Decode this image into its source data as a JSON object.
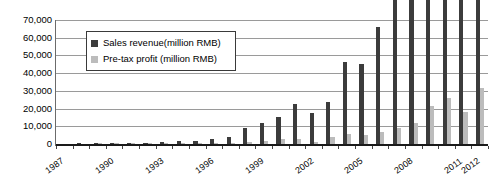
{
  "chart_data": {
    "type": "bar",
    "title": "",
    "xlabel": "",
    "ylabel": "",
    "ylim": [
      0,
      70000
    ],
    "ytick_step": 10000,
    "grid": true,
    "legend_position": "top-left-inside",
    "categories": [
      "1987",
      "1988",
      "1989",
      "1990",
      "1991",
      "1992",
      "1993",
      "1994",
      "1995",
      "1996",
      "1997",
      "1998",
      "1999",
      "2000",
      "2001",
      "2002",
      "2003",
      "2004",
      "2005",
      "2006",
      "2007",
      "2008",
      "2009",
      "2010",
      "2011",
      "2012"
    ],
    "xtick_labels_shown": [
      "1987",
      "1990",
      "1993",
      "1996",
      "1999",
      "2002",
      "2005",
      "2008",
      "2011",
      "2012"
    ],
    "ytick_labels": [
      "0",
      "10,000",
      "20,000",
      "30,000",
      "40,000",
      "50,000",
      "60,000",
      "70,000"
    ],
    "ytick_values": [
      0,
      10000,
      20000,
      30000,
      40000,
      50000,
      60000,
      70000
    ],
    "series": [
      {
        "name": "Sales revenue(million RMB)",
        "color": "#3c3c3c",
        "values": [
          0,
          10,
          50,
          120,
          250,
          800,
          1000,
          1500,
          1500,
          2600,
          4100,
          8900,
          12000,
          15200,
          22500,
          17500,
          23900,
          46200,
          45300,
          66000,
          93900,
          125200,
          149100,
          185200,
          203900,
          220200
        ]
      },
      {
        "name": "Pre-tax profit (million RMB)",
        "color": "#bcbcbc",
        "values": [
          0,
          0,
          5,
          15,
          30,
          90,
          120,
          180,
          200,
          330,
          520,
          1100,
          1500,
          2900,
          2700,
          1100,
          3800,
          5800,
          4900,
          6800,
          9300,
          11800,
          21400,
          25700,
          18100,
          31700
        ]
      }
    ],
    "value_scale_note": "plotted in million RMB"
  },
  "legend": {
    "items": [
      {
        "label": "Sales revenue(million RMB)",
        "swatch": "dark-gray"
      },
      {
        "label": "Pre-tax profit (million RMB)",
        "swatch": "light-gray"
      }
    ]
  },
  "colors": {
    "sales": "#3c3c3c",
    "profit": "#bcbcbc",
    "gridline": "#9a9a9a",
    "axis": "#1a1a1a",
    "background": "#ffffff"
  }
}
